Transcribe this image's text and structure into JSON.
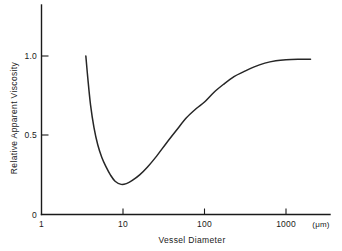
{
  "chart_data": {
    "type": "line",
    "title": "",
    "xlabel": "Vessel Diameter",
    "xunit": "(μm)",
    "ylabel": "Relative Apparent Viscosity",
    "xscale": "log",
    "yscale": "linear",
    "xlim": [
      1,
      2000
    ],
    "ylim": [
      0,
      1.15
    ],
    "grid": false,
    "legend": null,
    "xticks": [
      1,
      10,
      100,
      1000
    ],
    "xticklabels": [
      "1",
      "10",
      "100",
      "1000"
    ],
    "yticks": [
      0,
      0.5,
      1.0
    ],
    "yticklabels": [
      "0",
      "0.5",
      "1.0"
    ],
    "series": [
      {
        "name": "Relative apparent viscosity",
        "x": [
          3.5,
          3.7,
          4.0,
          4.4,
          4.9,
          5.5,
          6.2,
          7.0,
          8.0,
          9.5,
          11.0,
          13.0,
          16.0,
          20.0,
          26.0,
          34.0,
          45.0,
          60.0,
          80.0,
          100.0,
          130.0,
          170.0,
          230.0,
          300.0,
          400.0,
          550.0,
          750.0,
          1000.0,
          1400.0,
          2000.0
        ],
        "y": [
          1.0,
          0.86,
          0.69,
          0.55,
          0.44,
          0.36,
          0.3,
          0.25,
          0.21,
          0.19,
          0.195,
          0.215,
          0.25,
          0.3,
          0.37,
          0.45,
          0.53,
          0.61,
          0.67,
          0.71,
          0.77,
          0.82,
          0.87,
          0.9,
          0.93,
          0.955,
          0.97,
          0.977,
          0.98,
          0.98
        ]
      }
    ],
    "annotations": [
      {
        "label": "minimum",
        "x": 9.5,
        "y": 0.19
      },
      {
        "label": "curve-start",
        "x": 3.5,
        "y": 1.0
      },
      {
        "label": "plateau",
        "x": 2000,
        "y": 0.98
      }
    ]
  },
  "axes": {
    "y_tick_1": "1.0",
    "y_tick_05": "0.5",
    "y_tick_0": "0",
    "x_tick_1": "1",
    "x_tick_10": "10",
    "x_tick_100": "100",
    "x_tick_1000": "1000",
    "x_axis_title": "Vessel Diameter",
    "y_axis_title": "Relative Apparent Viscosity",
    "x_unit": "(μm)"
  },
  "style": {
    "curve_color": "#262626",
    "axis_color": "#1a1a1a",
    "background": "#ffffff"
  }
}
